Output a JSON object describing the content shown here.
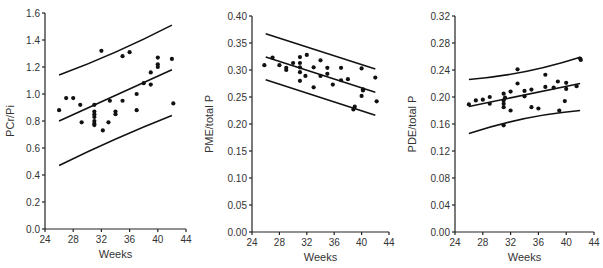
{
  "chart_data": [
    {
      "type": "scatter",
      "title": "",
      "xlabel": "Weeks",
      "ylabel": "PCr/Pi",
      "xlim": [
        24,
        44
      ],
      "ylim": [
        0.0,
        1.6
      ],
      "xticks": [
        24,
        28,
        32,
        36,
        40,
        44
      ],
      "yticks": [
        0.0,
        0.2,
        0.4,
        0.6,
        0.8,
        1.0,
        1.2,
        1.4,
        1.6
      ],
      "ytick_labels": [
        "0.0",
        "0.2",
        "0.4",
        "0.6",
        "0.8",
        "1.0",
        "1.2",
        "1.4",
        "1.6"
      ],
      "grid": false,
      "points": [
        [
          26,
          0.88
        ],
        [
          27,
          0.97
        ],
        [
          28,
          0.97
        ],
        [
          29,
          0.92
        ],
        [
          29.2,
          0.79
        ],
        [
          31,
          0.92
        ],
        [
          31,
          0.87
        ],
        [
          31,
          0.85
        ],
        [
          31,
          0.83
        ],
        [
          31,
          0.8
        ],
        [
          31,
          0.78
        ],
        [
          31,
          0.77
        ],
        [
          32,
          1.32
        ],
        [
          32.2,
          0.73
        ],
        [
          33,
          0.79
        ],
        [
          33.2,
          0.95
        ],
        [
          34,
          0.87
        ],
        [
          34,
          0.85
        ],
        [
          35,
          1.28
        ],
        [
          35,
          0.95
        ],
        [
          36,
          1.31
        ],
        [
          37,
          1.0
        ],
        [
          37,
          0.88
        ],
        [
          38,
          1.08
        ],
        [
          39,
          1.16
        ],
        [
          39,
          1.07
        ],
        [
          40,
          1.27
        ],
        [
          40,
          1.22
        ],
        [
          40,
          1.2
        ],
        [
          42,
          1.26
        ],
        [
          42.2,
          0.93
        ]
      ],
      "lines": [
        {
          "name": "upper",
          "x": [
            26,
            42
          ],
          "y": [
            1.14,
            1.51
          ],
          "curve": 0.03
        },
        {
          "name": "mean",
          "x": [
            26,
            42
          ],
          "y": [
            0.8,
            1.18
          ],
          "curve": 0
        },
        {
          "name": "lower",
          "x": [
            26,
            42
          ],
          "y": [
            0.47,
            0.84
          ],
          "curve": -0.02
        }
      ]
    },
    {
      "type": "scatter",
      "title": "",
      "xlabel": "Weeks",
      "ylabel": "PME/total P",
      "xlim": [
        24,
        44
      ],
      "ylim": [
        0.0,
        0.4
      ],
      "xticks": [
        24,
        28,
        32,
        36,
        40,
        44
      ],
      "yticks": [
        0.0,
        0.05,
        0.1,
        0.15,
        0.2,
        0.25,
        0.3,
        0.35,
        0.4
      ],
      "ytick_labels": [
        "0.00",
        "0.05",
        "0.10",
        "0.15",
        "0.20",
        "0.25",
        "0.30",
        "0.35",
        "0.40"
      ],
      "grid": false,
      "points": [
        [
          25.8,
          0.309
        ],
        [
          27,
          0.323
        ],
        [
          28,
          0.309
        ],
        [
          29,
          0.304
        ],
        [
          29,
          0.3
        ],
        [
          30,
          0.313
        ],
        [
          31,
          0.324
        ],
        [
          31,
          0.313
        ],
        [
          31,
          0.305
        ],
        [
          31,
          0.296
        ],
        [
          31,
          0.28
        ],
        [
          32,
          0.328
        ],
        [
          31.8,
          0.289
        ],
        [
          33,
          0.305
        ],
        [
          33,
          0.268
        ],
        [
          34,
          0.318
        ],
        [
          34,
          0.289
        ],
        [
          35,
          0.304
        ],
        [
          35,
          0.293
        ],
        [
          35.8,
          0.273
        ],
        [
          37,
          0.304
        ],
        [
          37,
          0.281
        ],
        [
          38,
          0.283
        ],
        [
          39,
          0.232
        ],
        [
          38.8,
          0.227
        ],
        [
          40,
          0.303
        ],
        [
          40,
          0.252
        ],
        [
          40.2,
          0.264
        ],
        [
          40.2,
          0.262
        ],
        [
          42,
          0.286
        ],
        [
          42.2,
          0.242
        ]
      ],
      "lines": [
        {
          "name": "upper",
          "x": [
            26,
            42
          ],
          "y": [
            0.367,
            0.302
          ],
          "curve": 0
        },
        {
          "name": "mean",
          "x": [
            26,
            42
          ],
          "y": [
            0.324,
            0.259
          ],
          "curve": 0
        },
        {
          "name": "lower",
          "x": [
            26,
            42
          ],
          "y": [
            0.282,
            0.216
          ],
          "curve": 0
        }
      ]
    },
    {
      "type": "scatter",
      "title": "",
      "xlabel": "Weeks",
      "ylabel": "PDE/total P",
      "xlim": [
        24,
        44
      ],
      "ylim": [
        0.0,
        0.32
      ],
      "xticks": [
        24,
        28,
        32,
        36,
        40,
        44
      ],
      "yticks": [
        0.0,
        0.04,
        0.08,
        0.12,
        0.16,
        0.2,
        0.24,
        0.28,
        0.32
      ],
      "ytick_labels": [
        "0.00",
        "0.04",
        "0.08",
        "0.12",
        "0.16",
        "0.20",
        "0.24",
        "0.28",
        "0.32"
      ],
      "grid": false,
      "points": [
        [
          26,
          0.189
        ],
        [
          27,
          0.195
        ],
        [
          28,
          0.196
        ],
        [
          29,
          0.2
        ],
        [
          29,
          0.19
        ],
        [
          31,
          0.205
        ],
        [
          31,
          0.195
        ],
        [
          31,
          0.19
        ],
        [
          31,
          0.185
        ],
        [
          31,
          0.158
        ],
        [
          31.2,
          0.199
        ],
        [
          32,
          0.208
        ],
        [
          32,
          0.18
        ],
        [
          33,
          0.241
        ],
        [
          33,
          0.22
        ],
        [
          34,
          0.209
        ],
        [
          34,
          0.201
        ],
        [
          35,
          0.211
        ],
        [
          35,
          0.185
        ],
        [
          36,
          0.183
        ],
        [
          37,
          0.233
        ],
        [
          37,
          0.215
        ],
        [
          38.2,
          0.214
        ],
        [
          38.8,
          0.223
        ],
        [
          39,
          0.18
        ],
        [
          40,
          0.221
        ],
        [
          40,
          0.212
        ],
        [
          39.8,
          0.194
        ],
        [
          41.5,
          0.216
        ],
        [
          42,
          0.257
        ],
        [
          42.1,
          0.255
        ]
      ],
      "lines": [
        {
          "name": "upper",
          "x": [
            26,
            42
          ],
          "y": [
            0.226,
            0.259
          ],
          "curve": 0.01
        },
        {
          "name": "mean",
          "x": [
            26,
            42
          ],
          "y": [
            0.186,
            0.22
          ],
          "curve": 0
        },
        {
          "name": "lower",
          "x": [
            26,
            42
          ],
          "y": [
            0.146,
            0.18
          ],
          "curve": -0.01
        }
      ]
    }
  ]
}
